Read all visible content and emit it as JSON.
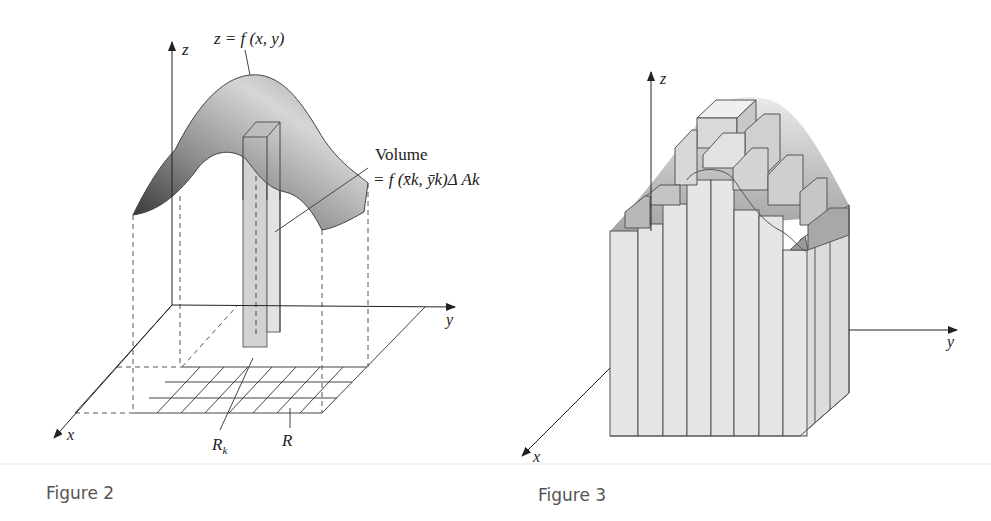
{
  "figure2": {
    "caption": "Figure 2",
    "surface_label": "z = f (x, y)",
    "volume_label_line1": "Volume",
    "volume_label_line2": "= f (x̄k, ȳk)Δ Ak",
    "axes": {
      "z": "z",
      "y": "y",
      "x": "x"
    },
    "region_label": "R",
    "subregion_label": "R",
    "subregion_subscript": "k",
    "colors": {
      "surface_dark": "#3a3a3a",
      "surface_light": "#d8d8d8",
      "column": "#d4d4d4",
      "lines": "#444444"
    }
  },
  "figure3": {
    "caption": "Figure 3",
    "axes": {
      "z": "z",
      "y": "y",
      "x": "x"
    },
    "colors": {
      "block_face": "#e6e6e6",
      "block_edge": "#555555",
      "surface_tint": "#bdbdbd"
    }
  }
}
